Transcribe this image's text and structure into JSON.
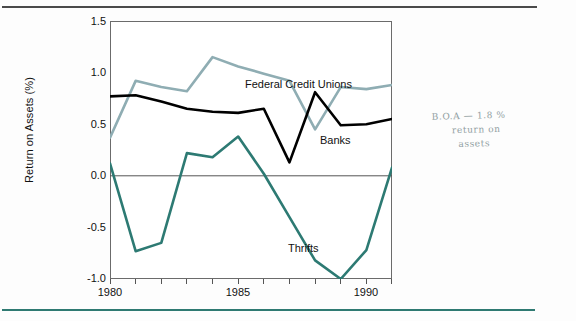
{
  "page": {
    "rule_top_color": "#4a4a4a",
    "rule_bottom_color": "#2f7a72"
  },
  "annotation": {
    "line1": "B.O.A — 1.8 %",
    "line2": "return on",
    "line3": "assets"
  },
  "chart_data": {
    "type": "line",
    "title": "",
    "xlabel": "",
    "ylabel": "Return on Assets (%)",
    "xlim": [
      1980,
      1991
    ],
    "ylim": [
      -1.0,
      1.5
    ],
    "grid": false,
    "zero_line": true,
    "legend": "inline-labels",
    "x": [
      1980,
      1981,
      1982,
      1983,
      1984,
      1985,
      1986,
      1987,
      1988,
      1989,
      1990,
      1991
    ],
    "xticks": [
      1980,
      1981,
      1982,
      1983,
      1984,
      1985,
      1986,
      1987,
      1988,
      1989,
      1990,
      1991
    ],
    "xtick_labels": [
      "1980",
      "",
      "",
      "",
      "",
      "1985",
      "",
      "",
      "",
      "",
      "1990",
      ""
    ],
    "yticks": [
      -1.0,
      -0.5,
      0.0,
      0.5,
      1.0,
      1.5
    ],
    "ytick_labels": [
      "-1.0",
      "-0.5",
      "0.0",
      "0.5",
      "1.0",
      "1.5"
    ],
    "series": [
      {
        "name": "Federal Credit Unions",
        "color": "#8fadb3",
        "label_text": "Federal Credit Unions",
        "values": [
          0.37,
          0.92,
          0.86,
          0.82,
          1.15,
          1.06,
          0.99,
          0.92,
          0.45,
          0.86,
          0.84,
          0.88
        ]
      },
      {
        "name": "Banks",
        "color": "#000000",
        "label_text": "Banks",
        "values": [
          0.77,
          0.78,
          0.72,
          0.65,
          0.62,
          0.61,
          0.65,
          0.13,
          0.81,
          0.49,
          0.5,
          0.55
        ]
      },
      {
        "name": "Thrifts",
        "color": "#2d7a73",
        "label_text": "Thrifts",
        "values": [
          0.12,
          -0.73,
          -0.65,
          0.22,
          0.18,
          0.38,
          0.02,
          -0.4,
          -0.82,
          -1.0,
          -0.72,
          0.08
        ]
      }
    ]
  }
}
